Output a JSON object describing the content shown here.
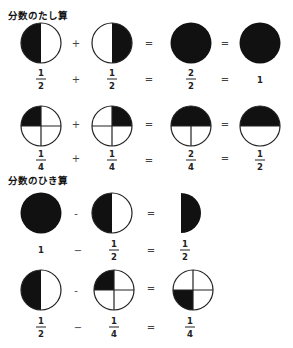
{
  "sections": [
    {
      "title": "分数のたし算",
      "rows": [
        {
          "shapes": [
            "half-left",
            "half-right",
            "full",
            "full"
          ],
          "shape_ops": [
            "+",
            "=",
            "="
          ],
          "terms": [
            {
              "n": "1",
              "d": "2"
            },
            {
              "n": "1",
              "d": "2"
            },
            {
              "n": "2",
              "d": "2"
            },
            {
              "whole": "1"
            }
          ],
          "term_ops": [
            "+",
            "=",
            "="
          ]
        },
        {
          "shapes": [
            "quarter-tl",
            "quarter-tr",
            "half-top-quartered",
            "half-top"
          ],
          "shape_ops": [
            "+",
            "=",
            "="
          ],
          "terms": [
            {
              "n": "1",
              "d": "4"
            },
            {
              "n": "1",
              "d": "4"
            },
            {
              "n": "2",
              "d": "4"
            },
            {
              "n": "1",
              "d": "2"
            }
          ],
          "term_ops": [
            "+",
            "=",
            "="
          ]
        }
      ]
    },
    {
      "title": "分数のひき算",
      "rows": [
        {
          "shapes": [
            "full",
            "half-left",
            "semicircle-right"
          ],
          "shape_ops": [
            "-",
            "="
          ],
          "terms": [
            {
              "whole": "1"
            },
            {
              "n": "1",
              "d": "2"
            },
            {
              "n": "1",
              "d": "2"
            }
          ],
          "term_ops": [
            "−",
            "="
          ]
        },
        {
          "shapes": [
            "half-left",
            "quarter-tl",
            "quarter-bl"
          ],
          "shape_ops": [
            "-",
            "="
          ],
          "terms": [
            {
              "n": "1",
              "d": "2"
            },
            {
              "n": "1",
              "d": "4"
            },
            {
              "n": "1",
              "d": "4"
            }
          ],
          "term_ops": [
            "−",
            "="
          ]
        }
      ]
    }
  ],
  "colors": {
    "fill": "#111111",
    "stroke": "#222222",
    "background": "#ffffff"
  }
}
